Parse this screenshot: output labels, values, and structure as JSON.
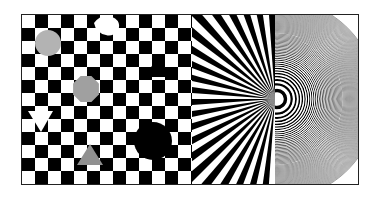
{
  "image": {
    "description": "Optical test pattern composed of three panels",
    "panels": [
      {
        "name": "checkerboard",
        "label": "Checkerboard with shapes",
        "square_size_px": 13,
        "colors": [
          "#000000",
          "#ffffff"
        ]
      },
      {
        "name": "starburst",
        "label": "Radial starburst (half Siemens star)",
        "colors": [
          "#000000",
          "#ffffff"
        ]
      },
      {
        "name": "zone-plate",
        "label": "Zone plate (concentric rings)",
        "colors": [
          "#000000",
          "#ffffff"
        ]
      }
    ],
    "shapes": [
      {
        "type": "circle",
        "color": "#b3b3b3",
        "cx": 47,
        "cy": 42,
        "r": 13
      },
      {
        "type": "octagon",
        "color": "#a0a0a0",
        "cx": 85,
        "cy": 88,
        "r": 14
      },
      {
        "type": "triangle-down",
        "color": "#ffffff",
        "cx": 40,
        "cy": 123
      },
      {
        "type": "triangle-up",
        "color": "#909090",
        "cx": 89,
        "cy": 155
      },
      {
        "type": "triangle-up",
        "color": "#000000",
        "cx": 157,
        "cy": 67
      },
      {
        "type": "circle",
        "color": "#000000",
        "cx": 152,
        "cy": 140,
        "r": 19
      },
      {
        "type": "blob",
        "color": "#ffffff",
        "cx": 105,
        "cy": 30
      }
    ]
  }
}
